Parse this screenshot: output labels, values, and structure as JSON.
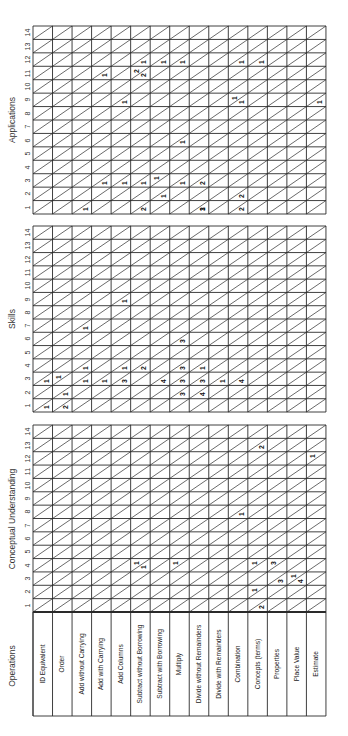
{
  "layout": {
    "col_left": 33,
    "col_width": 19.53,
    "num_cols": 15,
    "num_cells": 14,
    "label_top": 614,
    "label_bottom": 716
  },
  "header": {
    "operations_label": "Operations"
  },
  "operations": [
    "ID Equivalent",
    "Order",
    "Add without Carrying",
    "Add with Carrying",
    "Add Columns",
    "Subtract without Borrowing",
    "Subtract with Borrowing",
    "Multiply",
    "Divide without Remainders",
    "Divide with Remainders",
    "Combination",
    "Concepts (terms)",
    "Properties",
    "Place Value",
    "Estimate"
  ],
  "sections": [
    {
      "title": "Applications",
      "top": 26,
      "bottom": 214,
      "ticks": [
        "1",
        "2",
        "3",
        "4",
        "5",
        "6",
        "7",
        "8",
        "9",
        "10",
        "11",
        "12",
        "13",
        "14"
      ],
      "marks": [
        [
          2,
          1,
          "l",
          "1"
        ],
        [
          3,
          3,
          "l",
          "1"
        ],
        [
          3,
          11,
          "l",
          "1"
        ],
        [
          4,
          3,
          "l",
          "1"
        ],
        [
          4,
          9,
          "l",
          "1"
        ],
        [
          5,
          1,
          "l",
          "2"
        ],
        [
          5,
          3,
          "l",
          "1"
        ],
        [
          5,
          11,
          "u",
          "2"
        ],
        [
          5,
          11,
          "l",
          "2"
        ],
        [
          5,
          12,
          "l",
          "1"
        ],
        [
          6,
          2,
          "l",
          "1"
        ],
        [
          6,
          3,
          "u",
          "1"
        ],
        [
          6,
          12,
          "l",
          "1"
        ],
        [
          7,
          3,
          "l",
          "1"
        ],
        [
          7,
          6,
          "l",
          "1"
        ],
        [
          7,
          12,
          "l",
          "1"
        ],
        [
          8,
          1,
          "l",
          "1"
        ],
        [
          8,
          1,
          "l",
          "3"
        ],
        [
          8,
          3,
          "l",
          "2"
        ],
        [
          10,
          1,
          "l",
          "2"
        ],
        [
          10,
          2,
          "l",
          "2"
        ],
        [
          10,
          9,
          "u",
          "1"
        ],
        [
          10,
          9,
          "l",
          "1"
        ],
        [
          10,
          12,
          "l",
          "1"
        ],
        [
          11,
          12,
          "l",
          "1"
        ],
        [
          14,
          9,
          "l",
          "1"
        ]
      ]
    },
    {
      "title": "Skills",
      "top": 226,
      "bottom": 412,
      "ticks": [
        "1",
        "2",
        "3",
        "4",
        "5",
        "6",
        "7",
        "8",
        "9",
        "10",
        "11",
        "12",
        "13",
        "14"
      ],
      "marks": [
        [
          0,
          1,
          "l",
          "1"
        ],
        [
          0,
          3,
          "l",
          "1"
        ],
        [
          1,
          1,
          "l",
          "2"
        ],
        [
          1,
          2,
          "l",
          "1"
        ],
        [
          1,
          3,
          "u",
          "1"
        ],
        [
          2,
          3,
          "l",
          "1"
        ],
        [
          2,
          4,
          "l",
          "1"
        ],
        [
          2,
          7,
          "l",
          "1"
        ],
        [
          3,
          3,
          "l",
          "1"
        ],
        [
          4,
          3,
          "l",
          "3"
        ],
        [
          4,
          4,
          "l",
          "1"
        ],
        [
          4,
          9,
          "l",
          "1"
        ],
        [
          5,
          4,
          "l",
          "2"
        ],
        [
          6,
          3,
          "l",
          "4"
        ],
        [
          7,
          2,
          "l",
          "3"
        ],
        [
          7,
          3,
          "l",
          "3"
        ],
        [
          7,
          4,
          "l",
          "3"
        ],
        [
          7,
          6,
          "l",
          "3"
        ],
        [
          8,
          2,
          "l",
          "4"
        ],
        [
          8,
          3,
          "l",
          "3"
        ],
        [
          8,
          4,
          "l",
          "1"
        ],
        [
          9,
          3,
          "l",
          "1"
        ],
        [
          10,
          3,
          "l",
          "4"
        ]
      ]
    },
    {
      "title": "Conceptual Understanding",
      "top": 425,
      "bottom": 612,
      "ticks": [
        "1",
        "2",
        "3",
        "4",
        "5",
        "6",
        "7",
        "8",
        "9",
        "10",
        "11",
        "12",
        "13",
        "14"
      ],
      "marks": [
        [
          5,
          4,
          "u",
          "1"
        ],
        [
          5,
          4,
          "l",
          "1"
        ],
        [
          7,
          4,
          "u",
          "1"
        ],
        [
          10,
          8,
          "l",
          "1"
        ],
        [
          11,
          1,
          "l",
          "2"
        ],
        [
          11,
          2,
          "u",
          "1"
        ],
        [
          11,
          4,
          "u",
          "1"
        ],
        [
          11,
          13,
          "l",
          "2"
        ],
        [
          12,
          3,
          "l",
          "3"
        ],
        [
          12,
          4,
          "u",
          "3"
        ],
        [
          13,
          3,
          "u",
          "1"
        ],
        [
          13,
          3,
          "l",
          "4"
        ],
        [
          14,
          12,
          "u",
          "1"
        ]
      ]
    }
  ],
  "colors": {
    "line": "#2a2a2a",
    "text": "#222222",
    "background": "#ffffff"
  }
}
